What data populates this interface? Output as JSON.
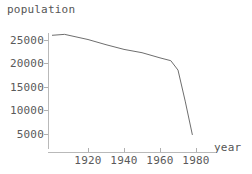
{
  "chart_data": {
    "type": "line",
    "title": "",
    "xlabel": "year",
    "ylabel": "population",
    "xlim": [
      1900,
      1982
    ],
    "ylim": [
      3800,
      26600
    ],
    "grid": false,
    "legend": "none",
    "x_ticks": [
      {
        "value": 1920,
        "label": "1920"
      },
      {
        "value": 1940,
        "label": "1940"
      },
      {
        "value": 1960,
        "label": "1960"
      },
      {
        "value": 1980,
        "label": "1980"
      }
    ],
    "y_ticks": [
      {
        "value": 25000,
        "label": "25000"
      },
      {
        "value": 20000,
        "label": "20000"
      },
      {
        "value": 15000,
        "label": "15000"
      },
      {
        "value": 10000,
        "label": "10000"
      },
      {
        "value": 5000,
        "label": "5000"
      }
    ],
    "series": [
      {
        "name": "population",
        "color": "#6e6e6e",
        "x": [
          1900,
          1907,
          1920,
          1930,
          1940,
          1950,
          1960,
          1966,
          1970,
          1974,
          1978
        ],
        "values": [
          26000,
          26200,
          25100,
          24000,
          23000,
          22300,
          21200,
          20600,
          18600,
          12000,
          4800
        ]
      }
    ]
  },
  "plot": {
    "y_axis_label": "population",
    "x_axis_label": "year",
    "axis_color": "#b9b9b9",
    "curve_color": "#6e6e6e",
    "text_color": "#5a5a5a",
    "background": "#ffffff"
  }
}
